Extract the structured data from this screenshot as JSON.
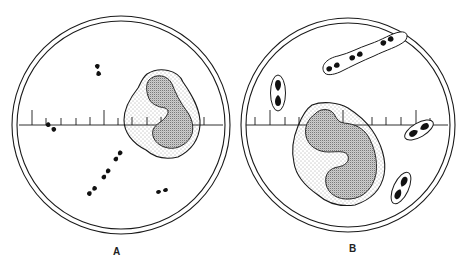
{
  "figure": {
    "type": "microscope-field illustration",
    "panels": [
      {
        "label": "A",
        "description": "Leukocyte with free diplococci scattered outside the cell",
        "elements": [
          "ocular-micrometer-scale",
          "leukocyte-with-lobed-nucleus",
          "extracellular-diplococci"
        ]
      },
      {
        "label": "B",
        "description": "Leukocyte with encapsulated diplococci / short chain in capsule",
        "elements": [
          "ocular-micrometer-scale",
          "leukocyte-with-lobed-nucleus",
          "encapsulated-diplococci",
          "encapsulated-chain"
        ]
      }
    ]
  },
  "colors": {
    "ink": "#1a1a1a",
    "background": "#ffffff",
    "stipple": "#555555"
  }
}
